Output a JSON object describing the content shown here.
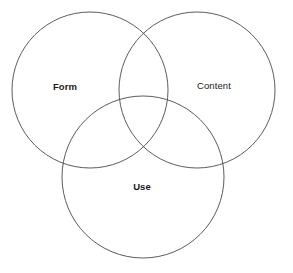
{
  "diagram": {
    "type": "venn-3-circle",
    "title": "",
    "background_color": "#ffffff",
    "stroke_color": "#4a4a4a",
    "text_color": "#1a1a1a",
    "canvas": {
      "width": 293,
      "height": 273
    },
    "sets": [
      {
        "id": "form",
        "label": "Form",
        "label_weight": "bold",
        "circle": {
          "cx": 90,
          "cy": 90,
          "r": 78
        },
        "label_position": {
          "x": 65,
          "y": 87
        }
      },
      {
        "id": "content",
        "label": "Content",
        "label_weight": "normal",
        "circle": {
          "cx": 197,
          "cy": 90,
          "r": 78
        },
        "label_position": {
          "x": 214,
          "y": 86
        }
      },
      {
        "id": "use",
        "label": "Use",
        "label_weight": "bold",
        "circle": {
          "cx": 143,
          "cy": 177,
          "r": 81
        },
        "label_position": {
          "x": 142,
          "y": 187
        }
      }
    ]
  }
}
